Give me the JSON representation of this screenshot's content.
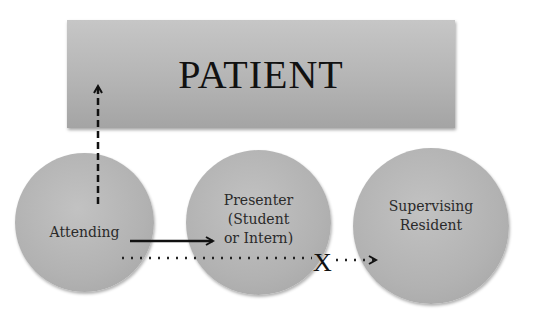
{
  "patient_box": {
    "label": "PATIENT"
  },
  "circles": [
    {
      "id": "attending",
      "label": "Attending"
    },
    {
      "id": "presenter",
      "label": "Presenter\n(Student\nor Intern)"
    },
    {
      "id": "supervising",
      "label": "Supervising\nResident"
    }
  ],
  "arrows": {
    "attending_to_patient": "dashed",
    "attending_to_presenter": "solid",
    "attending_to_supervising": "dotted, blocked"
  },
  "block_mark": "X",
  "colors": {
    "shape_fill": "#b5b5b5",
    "text": "#111111"
  }
}
